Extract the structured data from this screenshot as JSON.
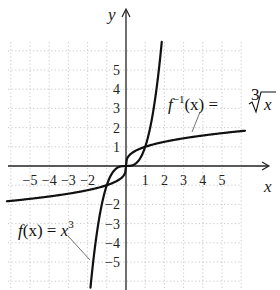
{
  "chart_data": {
    "type": "line",
    "title": "",
    "xlabel": "x",
    "ylabel": "y",
    "xlim": [
      -6.2,
      6.2
    ],
    "ylim": [
      -6.5,
      6.5
    ],
    "grid": true,
    "grid_style": "dotted",
    "x_ticks": [
      -5,
      -4,
      -3,
      -2,
      1,
      2,
      3,
      4,
      5
    ],
    "y_ticks": [
      5,
      4,
      3,
      2,
      1,
      -2,
      -3,
      -4,
      -5
    ],
    "x_tick_labels": [
      "−5",
      "−4",
      "−3",
      "−2",
      "1",
      "2",
      "3",
      "4",
      "5"
    ],
    "y_tick_labels": [
      "5",
      "4",
      "3",
      "2",
      "1",
      "−2",
      "−3",
      "−4",
      "−5"
    ],
    "series": [
      {
        "name": "f(x) = x^3",
        "function": "x^3",
        "x": [
          -1.85,
          -1.5,
          -1,
          -0.5,
          0,
          0.5,
          1,
          1.5,
          1.9
        ],
        "y": [
          -6.33,
          -3.375,
          -1,
          -0.125,
          0,
          0.125,
          1,
          3.375,
          6.86
        ]
      },
      {
        "name": "f^{-1}(x) = cube root of x",
        "function": "cbrt(x)",
        "x": [
          -6.2,
          -5,
          -3,
          -1,
          -0.125,
          0,
          0.125,
          1,
          3,
          5,
          6.2
        ],
        "y": [
          -1.84,
          -1.71,
          -1.44,
          -1,
          -0.5,
          0,
          0.5,
          1,
          1.44,
          1.71,
          1.84
        ]
      }
    ],
    "annotations": [
      {
        "text": "f(x) = x³",
        "points_to": "f(x) = x^3 curve near (-2.2, -4.7)"
      },
      {
        "text": "f⁻¹(x) = ∛x",
        "points_to": "cube root curve near (2.2, 1.3)"
      }
    ],
    "legend": "none (inline annotations)"
  },
  "labels": {
    "x_axis": "x",
    "y_axis": "y",
    "f_label_main": "f",
    "f_label_arg": "(x) = ",
    "f_label_var": "x",
    "f_label_exp": "3",
    "finv_label_main": "f",
    "finv_label_sup": "−1",
    "finv_label_arg": "(x) = ",
    "finv_label_root_index": "3",
    "finv_label_radicand": "x"
  }
}
